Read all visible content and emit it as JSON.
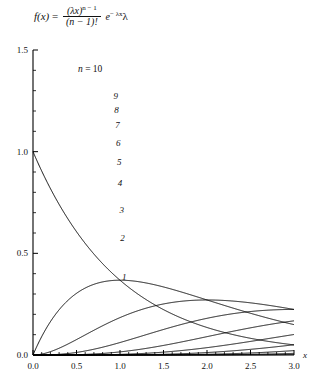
{
  "figure": {
    "formula": {
      "lhs": "f(x)",
      "equals": "=",
      "numerator": "(λx)",
      "numerator_exp": "n − 1",
      "denominator": "(n − 1)!",
      "exp_base": "e",
      "exp_power": "− λx",
      "trailing": "λ",
      "full": "f(x) = (λx)^(n−1) / (n−1)! · e^(−λx) λ"
    },
    "series_annotation": {
      "prefix": "n",
      "equals": "=",
      "value": "10",
      "text": "n = 10"
    }
  },
  "chart_data": {
    "type": "line",
    "title": "",
    "subtitle": "",
    "xlabel": "x",
    "ylabel": "",
    "xlim": [
      0.0,
      3.0
    ],
    "ylim": [
      0.0,
      1.5
    ],
    "grid": false,
    "legend_position": "inline-curve-labels",
    "x_ticks_major": [
      "0.0",
      "0.5",
      "1.0",
      "1.5",
      "2.0",
      "2.5",
      "3.0"
    ],
    "x_ticks_major_values": [
      0.0,
      0.5,
      1.0,
      1.5,
      2.0,
      2.5,
      3.0
    ],
    "x_ticks_minor_values": [
      0.1,
      0.2,
      0.3,
      0.4,
      0.6,
      0.7,
      0.8,
      0.9,
      1.1,
      1.2,
      1.3,
      1.4,
      1.6,
      1.7,
      1.8,
      1.9,
      2.1,
      2.2,
      2.3,
      2.4,
      2.6,
      2.7,
      2.8,
      2.9
    ],
    "y_ticks_major": [
      "0.0",
      "0.5",
      "1.0",
      "1.5"
    ],
    "y_ticks_major_values": [
      0.0,
      0.5,
      1.0,
      1.5
    ],
    "y_ticks_minor_values": [
      0.1,
      0.2,
      0.3,
      0.4,
      0.6,
      0.7,
      0.8,
      0.9,
      1.1,
      1.2,
      1.3,
      1.4
    ],
    "distribution": "Erlang (gamma) density",
    "lambda": 1.0,
    "curve_color": "#000000",
    "axis_color": "#000000",
    "series": [
      {
        "name": "1",
        "n": 1,
        "label": "1",
        "peak_x": 0.0,
        "peak_y": 1.0,
        "label_x": 1.05,
        "label_y": 0.385
      },
      {
        "name": "2",
        "n": 2,
        "label": "2",
        "peak_x": 1.0,
        "peak_y": 0.368,
        "label_x": 1.03,
        "label_y": 0.575
      },
      {
        "name": "3",
        "n": 3,
        "label": "3",
        "peak_x": 1.0,
        "peak_y": 0.541,
        "label_x": 1.02,
        "label_y": 0.715
      },
      {
        "name": "4",
        "n": 4,
        "label": "4",
        "peak_x": 1.0,
        "peak_y": 0.672,
        "label_x": 1.0,
        "label_y": 0.845
      },
      {
        "name": "5",
        "n": 5,
        "label": "5",
        "peak_x": 1.0,
        "peak_y": 0.78,
        "label_x": 0.99,
        "label_y": 0.95
      },
      {
        "name": "6",
        "n": 6,
        "label": "6",
        "peak_x": 1.0,
        "peak_y": 0.875,
        "label_x": 0.98,
        "label_y": 1.043
      },
      {
        "name": "7",
        "n": 7,
        "label": "7",
        "peak_x": 1.0,
        "peak_y": 0.961,
        "label_x": 0.97,
        "label_y": 1.13
      },
      {
        "name": "8",
        "n": 8,
        "label": "8",
        "peak_x": 1.0,
        "peak_y": 1.038,
        "label_x": 0.96,
        "label_y": 1.205
      },
      {
        "name": "9",
        "n": 9,
        "label": "9",
        "peak_x": 1.0,
        "peak_y": 1.11,
        "label_x": 0.95,
        "label_y": 1.272
      },
      {
        "name": "10",
        "n": 10,
        "label": "10",
        "peak_x": 1.0,
        "peak_y": 1.178,
        "label_x": 0.93,
        "label_y": 1.395
      }
    ]
  }
}
